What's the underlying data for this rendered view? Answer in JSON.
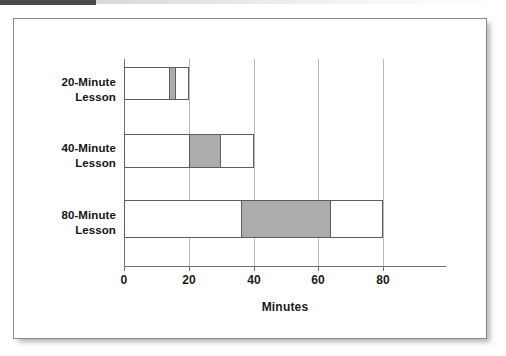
{
  "figure": {
    "background_color": "#ffffff",
    "border_color": "#8a8a8a",
    "bar_fill_color": "#ffffff",
    "bar_edge_color": "#5d5d5d",
    "segment_fill_color": "#acacac",
    "gridline_color": "#b9b9b9",
    "axis_color": "#6e6e6e"
  },
  "chart_data": {
    "type": "bar",
    "orientation": "horizontal",
    "title": "",
    "xlabel": "Minutes",
    "ylabel": "",
    "xlim": [
      0,
      100
    ],
    "xticks": [
      0,
      20,
      40,
      60,
      80
    ],
    "xtick_labels": [
      "0",
      "20",
      "40",
      "60",
      "80"
    ],
    "grid": "vertical gridlines at each x tick",
    "legend": "none",
    "categories": [
      "20-Minute Lesson",
      "40-Minute Lesson",
      "80-Minute Lesson"
    ],
    "category_lines": [
      [
        "20-Minute",
        "Lesson"
      ],
      [
        "40-Minute",
        "Lesson"
      ],
      [
        "80-Minute",
        "Lesson"
      ]
    ],
    "bars": [
      {
        "category": "20-Minute Lesson",
        "start": 0,
        "end": 20,
        "total": 20,
        "highlight_start": 14,
        "highlight_end": 16,
        "highlight_duration": 2
      },
      {
        "category": "40-Minute Lesson",
        "start": 0,
        "end": 40,
        "total": 40,
        "highlight_start": 20,
        "highlight_end": 30,
        "highlight_duration": 10
      },
      {
        "category": "80-Minute Lesson",
        "start": 0,
        "end": 80,
        "total": 80,
        "highlight_start": 36,
        "highlight_end": 64,
        "highlight_duration": 28
      }
    ],
    "series": [
      {
        "name": "Lesson duration (white)",
        "values": [
          20,
          40,
          80
        ]
      },
      {
        "name": "Highlighted interval (gray)",
        "values": [
          2,
          10,
          28
        ]
      }
    ]
  }
}
